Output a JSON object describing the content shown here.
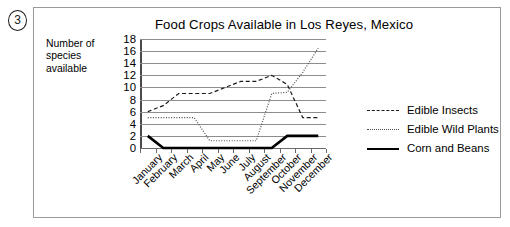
{
  "item_number": "3",
  "y_axis_label": "Number of\nspecies\navailable",
  "y_axis_label_lines": [
    "Number of",
    "species",
    "available"
  ],
  "legend": {
    "items": [
      {
        "label": "Edible Insects",
        "style": "dashed",
        "color": "#1a1a1a"
      },
      {
        "label": "Edible Wild Plants",
        "style": "dotted",
        "color": "#4a4a4a"
      },
      {
        "label": "Corn and Beans",
        "style": "solid",
        "color": "#000000"
      }
    ]
  },
  "chart_data": {
    "type": "line",
    "title": "Food Crops Available in Los Reyes, Mexico",
    "xlabel": "",
    "ylabel": "Number of species available",
    "ylim": [
      0,
      18
    ],
    "ytick_labels": [
      "0",
      "2",
      "4",
      "6",
      "8",
      "10",
      "12",
      "14",
      "16",
      "18"
    ],
    "yticks": [
      0,
      2,
      4,
      6,
      8,
      10,
      12,
      14,
      16,
      18
    ],
    "grid": true,
    "legend_position": "right",
    "categories": [
      "January",
      "February",
      "March",
      "April",
      "May",
      "June",
      "July",
      "August",
      "September",
      "October",
      "November",
      "December"
    ],
    "series": [
      {
        "name": "Edible Insects",
        "style": "dashed",
        "color": "#1a1a1a",
        "values": [
          6,
          7,
          9,
          9,
          9,
          10,
          11,
          11,
          12,
          10.5,
          5,
          5
        ]
      },
      {
        "name": "Edible Wild Plants",
        "style": "dotted",
        "color": "#4a4a4a",
        "values": [
          5,
          5,
          5,
          5,
          1.2,
          1.2,
          1.2,
          1.2,
          9,
          9.2,
          12.5,
          16.5
        ]
      },
      {
        "name": "Corn and Beans",
        "style": "solid",
        "color": "#000000",
        "values": [
          2,
          0,
          0,
          0,
          0,
          0,
          0,
          0,
          0,
          2,
          2,
          2
        ]
      }
    ]
  }
}
